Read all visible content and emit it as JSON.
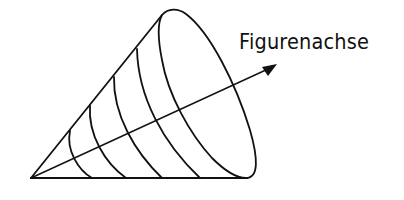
{
  "figure": {
    "type": "cone-with-axis",
    "label": "Figurenachse",
    "stroke_color": "#111111",
    "background": "#ffffff",
    "apex": [
      31,
      178
    ],
    "ring_count": 5
  }
}
